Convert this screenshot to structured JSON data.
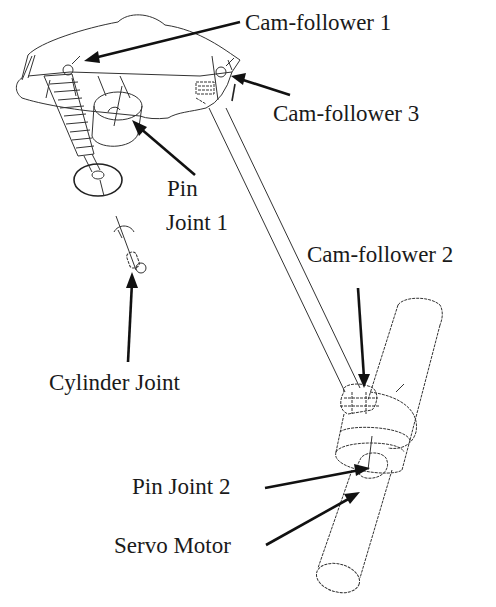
{
  "figure": {
    "type": "mechanism-wireframe-diagram",
    "background": "#ffffff",
    "line_color": "#333333"
  },
  "labels": {
    "cam_follower_1": "Cam-follower 1",
    "cam_follower_3": "Cam-follower 3",
    "pin_joint_1_line1": "Pin",
    "pin_joint_1_line2": "Joint 1",
    "cylinder_joint": "Cylinder Joint",
    "cam_follower_2": "Cam-follower 2",
    "pin_joint_2": "Pin Joint 2",
    "servo_motor": "Servo Motor"
  },
  "components": [
    {
      "name": "rocker-arm-body"
    },
    {
      "name": "valve-spring"
    },
    {
      "name": "valve-head"
    },
    {
      "name": "pin-joint-1-cylinder"
    },
    {
      "name": "push-rod"
    },
    {
      "name": "cam-shaft-cylinder"
    },
    {
      "name": "cam-assembly"
    },
    {
      "name": "cylinder-joint-marker"
    }
  ]
}
